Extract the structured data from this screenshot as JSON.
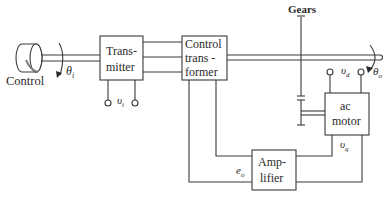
{
  "diagram": {
    "title": "",
    "knob": {
      "label": "Control",
      "angle_symbol": "θ",
      "angle_subscript": "i"
    },
    "blocks": {
      "transmitter": {
        "line1": "Trans-",
        "line2": "mitter"
      },
      "control_transformer": {
        "line1": "Control",
        "line2": "trans -",
        "line3": "former"
      },
      "ac_motor": {
        "line1": "ac",
        "line2": "motor"
      },
      "amplifier": {
        "line1": "Amp-",
        "line2": "lifier"
      }
    },
    "labels": {
      "gears": "Gears",
      "vi_symbol": "υ",
      "vi_subscript": "i",
      "vd_symbol": "υ",
      "vd_subscript": "d",
      "vq_symbol": "υ",
      "vq_subscript": "q",
      "eo_symbol": "e",
      "eo_subscript": "o",
      "theta_o_symbol": "θ",
      "theta_o_subscript": "o"
    },
    "colors": {
      "line": "#3a3a3a",
      "text": "#2a2a2a",
      "background": "#ffffff"
    }
  }
}
